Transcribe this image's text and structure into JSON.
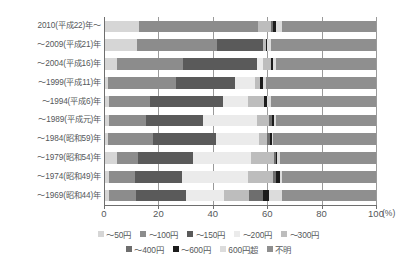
{
  "chart_data": {
    "type": "bar",
    "orientation": "horizontal",
    "stacked": true,
    "normalized": true,
    "title": "",
    "xlabel": "(%)",
    "ylabel": "",
    "xlim": [
      0,
      100
    ],
    "xticks": [
      "0",
      "20",
      "40",
      "60",
      "80",
      "100"
    ],
    "x_unit": "(%)",
    "grid": true,
    "legend_position": "bottom",
    "categories": [
      "2010(平成22)年～",
      "～2009(平成21)年",
      "～2004(平成16)年",
      "～1999(平成11)年",
      "～1994(平成6)年",
      "～1989(平成元)年",
      "～1984(昭和59)年",
      "～1979(昭和54)年",
      "～1974(昭和49)年",
      "～1969(昭和44)年"
    ],
    "series": [
      {
        "name": "～50円",
        "color": "#d6d6d6",
        "values": [
          13.0,
          12.0,
          4.6,
          1.5,
          1.8,
          1.8,
          1.5,
          4.6,
          1.8,
          1.8
        ]
      },
      {
        "name": "～100円",
        "color": "#8c8c8c",
        "values": [
          43.5,
          29.5,
          24.5,
          25.0,
          15.0,
          13.5,
          16.5,
          8.0,
          9.5,
          10.0
        ]
      },
      {
        "name": "～150円",
        "color": "#5a5a5a",
        "values": [
          0.0,
          17.0,
          27.0,
          21.5,
          27.0,
          21.0,
          23.0,
          20.0,
          17.5,
          18.5
        ]
      },
      {
        "name": "～200円",
        "color": "#ebebeb",
        "values": [
          0.0,
          0.0,
          2.4,
          7.5,
          9.0,
          20.0,
          16.0,
          21.5,
          24.0,
          14.0
        ]
      },
      {
        "name": "～300円",
        "color": "#bdbdbd",
        "values": [
          5.0,
          1.0,
          3.0,
          2.0,
          6.0,
          4.5,
          3.0,
          8.5,
          9.5,
          9.0
        ]
      },
      {
        "name": "～400円",
        "color": "#6e6e6e",
        "values": [
          0.8,
          0.0,
          0.0,
          0.0,
          0.0,
          1.0,
          1.0,
          0.5,
          1.0,
          5.0
        ]
      },
      {
        "name": "～600円",
        "color": "#1c1c1c",
        "values": [
          0.9,
          0.5,
          0.6,
          0.9,
          1.0,
          0.6,
          0.8,
          0.6,
          1.5,
          2.5
        ]
      },
      {
        "name": "600円超",
        "color": "#dcdcdc",
        "values": [
          2.3,
          1.5,
          1.0,
          1.0,
          1.5,
          1.0,
          0.5,
          1.0,
          0.5,
          4.5
        ]
      },
      {
        "name": "不明",
        "color": "#8f8f8f",
        "values": [
          34.5,
          38.5,
          36.9,
          40.6,
          38.7,
          36.6,
          37.7,
          35.3,
          34.7,
          34.7
        ]
      }
    ]
  },
  "legend": {
    "row1": [
      {
        "label": "～50円",
        "color": "#d6d6d6"
      },
      {
        "label": "～100円",
        "color": "#8c8c8c"
      },
      {
        "label": "～150円",
        "color": "#5a5a5a"
      },
      {
        "label": "～200円",
        "color": "#ebebeb"
      },
      {
        "label": "～300円",
        "color": "#bdbdbd"
      }
    ],
    "row2": [
      {
        "label": "～400円",
        "color": "#6e6e6e"
      },
      {
        "label": "～600円",
        "color": "#1c1c1c"
      },
      {
        "label": "600円超",
        "color": "#dcdcdc"
      },
      {
        "label": "不明",
        "color": "#8f8f8f"
      }
    ]
  }
}
